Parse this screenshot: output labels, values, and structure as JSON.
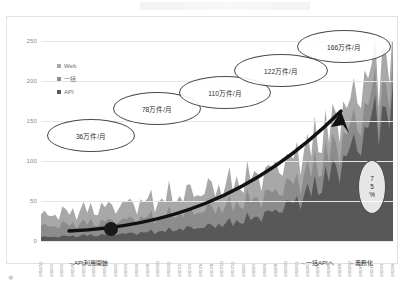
{
  "chart_data": {
    "type": "area",
    "stacked": true,
    "title": "",
    "xlabel": "",
    "ylabel": "",
    "ylim": [
      0,
      250
    ],
    "yticks": [
      0,
      50,
      100,
      150,
      200,
      250
    ],
    "grid": true,
    "legend_position": "top-left",
    "legend": [
      "Web",
      "一括",
      "API"
    ],
    "colors": {
      "Web": "#a8a8a8",
      "一括": "#8c8c8c",
      "API": "#585858"
    },
    "x": [
      "2014/12",
      "2015/2",
      "2015/4",
      "2015/6",
      "2015/8",
      "2015/10",
      "2015/12",
      "2016/2",
      "2016/4",
      "2016/6",
      "2016/8",
      "2016/10",
      "2016/12",
      "2017/2",
      "2017/4",
      "2017/6",
      "2017/8",
      "2017/10",
      "2017/12",
      "2018/2",
      "2018/4",
      "2018/6",
      "2018/8",
      "2018/10",
      "2018/12",
      "2019/2",
      "2019/4",
      "2019/6",
      "2019/8",
      "2019/10",
      "2019/12",
      "2020/2",
      "2020/4",
      "2020/6"
    ],
    "series": [
      {
        "name": "API",
        "values": [
          5,
          5,
          6,
          6,
          7,
          7,
          8,
          9,
          9,
          10,
          11,
          12,
          13,
          15,
          16,
          17,
          19,
          21,
          23,
          26,
          29,
          33,
          38,
          44,
          51,
          60,
          70,
          82,
          96,
          112,
          128,
          148,
          168,
          150
        ]
      },
      {
        "name": "一括",
        "values": [
          14,
          13,
          15,
          14,
          16,
          15,
          17,
          16,
          18,
          17,
          19,
          18,
          20,
          19,
          21,
          20,
          22,
          21,
          23,
          22,
          24,
          23,
          25,
          24,
          26,
          25,
          27,
          26,
          28,
          27,
          29,
          28,
          30,
          26
        ]
      },
      {
        "name": "Web",
        "values": [
          14,
          13,
          16,
          15,
          18,
          16,
          19,
          17,
          21,
          18,
          22,
          19,
          24,
          20,
          26,
          22,
          28,
          23,
          30,
          24,
          32,
          25,
          34,
          26,
          36,
          27,
          38,
          28,
          40,
          29,
          42,
          30,
          44,
          30
        ]
      }
    ],
    "annotations": [
      {
        "label": "36万件/月",
        "shape": "ellipse"
      },
      {
        "label": "78万件/月",
        "shape": "ellipse"
      },
      {
        "label": "110万件/月",
        "shape": "ellipse"
      },
      {
        "label": "122万件/月",
        "shape": "ellipse"
      },
      {
        "label": "166万件/月",
        "shape": "ellipse"
      }
    ],
    "percent_callout": {
      "digit1": "7",
      "digit2": "5",
      "unit": "%"
    },
    "event_notes": [
      {
        "label": "→API利用開始"
      },
      {
        "label": "→一括APIへ"
      },
      {
        "label": "→義務化"
      }
    ],
    "trend_arrow": true,
    "marker_point": true
  },
  "caption": "※　　　　　　　　　　　　　　　　　　　　　　　　"
}
